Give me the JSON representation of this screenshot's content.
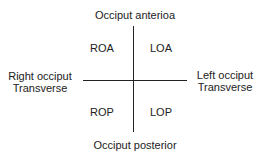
{
  "diagram": {
    "top_label": "Occiput anterioa",
    "bottom_label": "Occiput posterior",
    "left_label_line1": "Right occiput",
    "left_label_line2": "Transverse",
    "right_label_line1": "Left occiput",
    "right_label_line2": "Transverse",
    "quadrants": {
      "upper_left": "ROA",
      "upper_right": "LOA",
      "lower_left": "ROP",
      "lower_right": "LOP"
    }
  }
}
